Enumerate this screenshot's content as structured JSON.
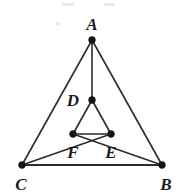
{
  "figure": {
    "canvas": {
      "width": 176,
      "height": 194
    },
    "background_color": "#ffffff",
    "line_color": "#2b2b31",
    "dot_color": "#141418",
    "label_color": "#1a1a1f"
  },
  "points": [
    {
      "id": "A",
      "label": "A",
      "x": 92,
      "y": 40,
      "label_x": 92,
      "label_y": 30,
      "role": "apex-vertex"
    },
    {
      "id": "B",
      "label": "B",
      "x": 162,
      "y": 165,
      "label_x": 166,
      "label_y": 190,
      "role": "base-vertex-right"
    },
    {
      "id": "C",
      "label": "C",
      "x": 22,
      "y": 165,
      "label_x": 21,
      "label_y": 190,
      "role": "base-vertex-left"
    },
    {
      "id": "D",
      "label": "D",
      "x": 92,
      "y": 100,
      "label_x": 73,
      "label_y": 106,
      "role": "interior-point"
    },
    {
      "id": "E",
      "label": "E",
      "x": 111,
      "y": 134,
      "label_x": 111,
      "label_y": 158,
      "role": "interior-point"
    },
    {
      "id": "F",
      "label": "F",
      "x": 73,
      "y": 134,
      "label_x": 73,
      "label_y": 158,
      "role": "interior-point"
    }
  ],
  "segments": [
    {
      "id": "AC",
      "from": "A",
      "to": "C",
      "name": "segment-a-c"
    },
    {
      "id": "AB",
      "from": "A",
      "to": "B",
      "name": "segment-a-b"
    },
    {
      "id": "CB",
      "from": "C",
      "to": "B",
      "name": "segment-c-b"
    },
    {
      "id": "AD",
      "from": "A",
      "to": "D",
      "name": "segment-a-d"
    },
    {
      "id": "DF",
      "from": "D",
      "to": "F",
      "name": "segment-d-f"
    },
    {
      "id": "DE",
      "from": "D",
      "to": "E",
      "name": "segment-d-e"
    },
    {
      "id": "FE",
      "from": "F",
      "to": "E",
      "name": "segment-f-e"
    },
    {
      "id": "CE",
      "from": "C",
      "to": "E",
      "name": "segment-c-e"
    },
    {
      "id": "BF",
      "from": "B",
      "to": "F",
      "name": "segment-b-f"
    }
  ],
  "specks": [
    {
      "x": 62,
      "y": 3,
      "width": 12,
      "height": 3
    },
    {
      "x": 104,
      "y": 3,
      "width": 11,
      "height": 3
    },
    {
      "x": 56,
      "y": 22,
      "width": 4,
      "height": 3
    }
  ]
}
